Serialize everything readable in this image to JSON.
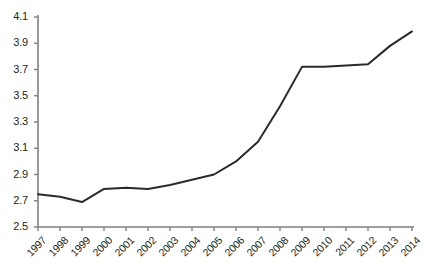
{
  "chart_data": {
    "type": "line",
    "title": "",
    "subtitle": "",
    "xlabel": "",
    "ylabel": "",
    "grid": false,
    "legend": null,
    "categories": [
      "1997",
      "1998",
      "1999",
      "2000",
      "2001",
      "2002",
      "2003",
      "2004",
      "2005",
      "2006",
      "2007",
      "2008",
      "2009",
      "2010",
      "2011",
      "2012",
      "2013",
      "2014"
    ],
    "values": [
      2.75,
      2.73,
      2.69,
      2.79,
      2.8,
      2.79,
      2.82,
      2.86,
      2.9,
      3.0,
      3.15,
      3.42,
      3.72,
      3.72,
      3.73,
      3.74,
      3.88,
      3.99
    ],
    "series": [
      {
        "name": "series-1",
        "values": [
          2.75,
          2.73,
          2.69,
          2.79,
          2.8,
          2.79,
          2.82,
          2.86,
          2.9,
          3.0,
          3.15,
          3.42,
          3.72,
          3.72,
          3.73,
          3.74,
          3.88,
          3.99
        ],
        "color": "#2b2b2b"
      }
    ],
    "ylim": [
      2.5,
      4.1
    ],
    "ytick_step": 0.2,
    "ytick_labels": [
      "4.1",
      "3.9",
      "3.7",
      "3.5",
      "3.3",
      "3.1",
      "2.9",
      "2.7",
      "2.5"
    ],
    "ytick_values": [
      4.1,
      3.9,
      3.7,
      3.5,
      3.3,
      3.1,
      2.9,
      2.7,
      2.5
    ],
    "xtick_labels": [
      "1997",
      "1998",
      "1999",
      "2000",
      "2001",
      "2002",
      "2003",
      "2004",
      "2005",
      "2006",
      "2007",
      "2008",
      "2009",
      "2010",
      "2011",
      "2012",
      "2013",
      "2014"
    ],
    "xtick_rotation": -45,
    "axis_color": "#808080",
    "line_color": "#2b2b2b",
    "line_width": 2,
    "background_color": "#ffffff",
    "text_color": "#231f20"
  }
}
